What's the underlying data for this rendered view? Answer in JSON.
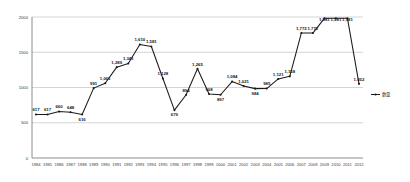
{
  "chart_data": {
    "type": "line",
    "title": "",
    "xlabel": "",
    "ylabel": "",
    "ylim": [
      0,
      2000
    ],
    "yticks": [
      0,
      500,
      1000,
      1500,
      2000
    ],
    "ytick_labels": [
      "0",
      "500",
      "1000",
      "1500",
      "2000"
    ],
    "grid": true,
    "legend_position": "right",
    "categories": [
      "1984",
      "1985",
      "1986",
      "1987",
      "1988",
      "1989",
      "1990",
      "1991",
      "1992",
      "1993",
      "1994",
      "1995",
      "1996",
      "1997",
      "1998",
      "1999",
      "2000",
      "2001",
      "2002",
      "2003",
      "2004",
      "2005",
      "2006",
      "2007",
      "2008",
      "2009",
      "2010",
      "2011",
      "2012"
    ],
    "series": [
      {
        "name": "数量",
        "values": [
          617,
          617,
          660,
          648,
          616,
          991,
          1061,
          1289,
          1341,
          1610,
          1581,
          1128,
          679,
          894,
          1265,
          908,
          897,
          1084,
          1021,
          984,
          985,
          1121,
          1158,
          1772,
          1772,
          1981,
          1981,
          1981,
          1052
        ],
        "data_labels": [
          "617",
          "617",
          "660",
          "648",
          "616",
          "991",
          "1,061",
          "1,289",
          "1,341",
          "1,610",
          "1,581",
          "1,128",
          "679",
          "894",
          "1,265",
          "908",
          "897",
          "1,084",
          "1,021",
          "984",
          "985",
          "1,121",
          "1,158",
          "1,772",
          "1,772",
          "1,981",
          "1,981",
          "1,981",
          "1,052"
        ]
      }
    ],
    "plotted_values": [
      617,
      617,
      660,
      648,
      616,
      991,
      1061,
      1289,
      1341,
      1610,
      1581,
      1128,
      679,
      894,
      1265,
      908,
      897,
      1084,
      1021,
      984,
      985,
      1121,
      1158,
      1772,
      1981,
      1052
    ],
    "label_visibility": [
      true,
      true,
      true,
      true,
      true,
      true,
      true,
      true,
      true,
      true,
      true,
      true,
      true,
      true,
      true,
      true,
      true,
      true,
      true,
      true,
      true,
      true,
      true,
      true,
      true,
      true,
      true,
      true,
      true
    ],
    "colors": {
      "line": "#1a1a1a",
      "marker": "#1a1a1a",
      "grid": "#b9b9b9",
      "axis": "#6e6e6e",
      "text": "#3a3a3a",
      "background": "#ffffff"
    }
  },
  "legend": {
    "entries": [
      {
        "label": "数量",
        "marker": "line-with-dot"
      }
    ]
  }
}
